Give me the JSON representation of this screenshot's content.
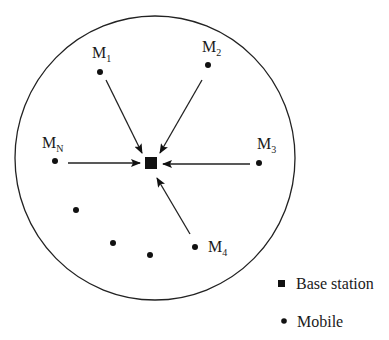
{
  "diagram": {
    "type": "cell-uplink",
    "cell": {
      "cx": 155,
      "cy": 158,
      "rx": 140,
      "ry": 142
    },
    "base_station": {
      "x": 151,
      "y": 163,
      "size": 12
    },
    "mobiles": [
      {
        "id": "M1",
        "label": "M",
        "sub": "1",
        "x": 100,
        "y": 72,
        "lx": 92,
        "ly": 58,
        "arrow": [
          106,
          80,
          142,
          153
        ]
      },
      {
        "id": "M2",
        "label": "M",
        "sub": "2",
        "x": 208,
        "y": 65,
        "lx": 202,
        "ly": 52,
        "arrow": [
          202,
          80,
          160,
          153
        ]
      },
      {
        "id": "M3",
        "label": "M",
        "sub": "3",
        "x": 259,
        "y": 163,
        "lx": 257,
        "ly": 149,
        "arrow": [
          250,
          164,
          163,
          164
        ]
      },
      {
        "id": "M4",
        "label": "M",
        "sub": "4",
        "x": 195,
        "y": 247,
        "lx": 208,
        "ly": 252,
        "arrow": [
          190,
          234,
          157,
          178
        ]
      },
      {
        "id": "MN",
        "label": "M",
        "sub": "N",
        "x": 55,
        "y": 161,
        "lx": 42,
        "ly": 148,
        "arrow": [
          68,
          163,
          140,
          163
        ]
      },
      {
        "id": "m6",
        "x": 76,
        "y": 210
      },
      {
        "id": "m7",
        "x": 113,
        "y": 243
      },
      {
        "id": "m8",
        "x": 150,
        "y": 255
      }
    ]
  },
  "legend": {
    "base_station": "Base station",
    "mobile": "Mobile"
  }
}
